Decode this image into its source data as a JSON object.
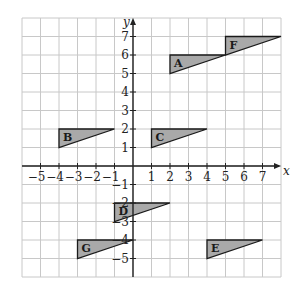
{
  "chart_data": {
    "type": "diagram",
    "title": "",
    "xlabel": "x",
    "ylabel": "y",
    "xlim": [
      -6,
      8
    ],
    "ylim": [
      -6,
      8
    ],
    "grid": true,
    "x_ticks": [
      -5,
      -4,
      -3,
      -2,
      -1,
      1,
      2,
      3,
      4,
      5,
      6,
      7
    ],
    "y_ticks": [
      -5,
      -4,
      -3,
      -2,
      -1,
      1,
      2,
      3,
      4,
      5,
      6,
      7
    ],
    "shapes": [
      {
        "label": "A",
        "vertices": [
          [
            2,
            5
          ],
          [
            2,
            6
          ],
          [
            5,
            6
          ]
        ]
      },
      {
        "label": "B",
        "vertices": [
          [
            -4,
            1
          ],
          [
            -4,
            2
          ],
          [
            -1,
            2
          ]
        ]
      },
      {
        "label": "C",
        "vertices": [
          [
            1,
            1
          ],
          [
            1,
            2
          ],
          [
            4,
            2
          ]
        ]
      },
      {
        "label": "D",
        "vertices": [
          [
            -1,
            -3
          ],
          [
            -1,
            -2
          ],
          [
            2,
            -2
          ]
        ]
      },
      {
        "label": "E",
        "vertices": [
          [
            4,
            -5
          ],
          [
            4,
            -4
          ],
          [
            7,
            -4
          ]
        ]
      },
      {
        "label": "F",
        "vertices": [
          [
            5,
            6
          ],
          [
            5,
            7
          ],
          [
            8,
            7
          ]
        ]
      },
      {
        "label": "G",
        "vertices": [
          [
            -3,
            -5
          ],
          [
            -3,
            -4
          ],
          [
            0,
            -4
          ]
        ]
      }
    ],
    "fill_color": "#a9a9a9"
  }
}
